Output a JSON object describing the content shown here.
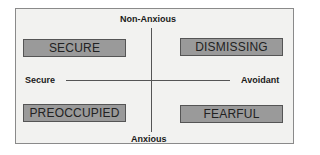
{
  "diagram": {
    "axes": {
      "top": "Non-Anxious",
      "bottom": "Anxious",
      "left": "Secure",
      "right": "Avoidant"
    },
    "quadrants": {
      "top_left": "SECURE",
      "top_right": "DISMISSING",
      "bottom_left": "PREOCCUPIED",
      "bottom_right": "FEARFUL"
    },
    "colors": {
      "background": "#f2f2f0",
      "box_fill": "#9a9a9a",
      "line": "#555555"
    }
  }
}
